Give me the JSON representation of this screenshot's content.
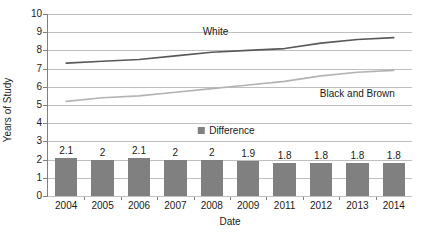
{
  "chart_data": {
    "type": "line",
    "title": "",
    "xlabel": "Date",
    "ylabel": "Years of Study",
    "categories": [
      "2004",
      "2005",
      "2006",
      "2007",
      "2008",
      "2009",
      "2011",
      "2012",
      "2013",
      "2014"
    ],
    "ylim": [
      0,
      10
    ],
    "y_ticks": [
      "0",
      "1",
      "2",
      "3",
      "4",
      "5",
      "6",
      "7",
      "8",
      "9",
      "10"
    ],
    "grid": true,
    "legend_position": "inside-center",
    "series": [
      {
        "name": "White",
        "type": "line",
        "color": "#595959",
        "values": [
          7.3,
          7.4,
          7.5,
          7.7,
          7.9,
          8.0,
          8.1,
          8.4,
          8.6,
          8.7
        ]
      },
      {
        "name": "Black and Brown",
        "type": "line",
        "color": "#b3b3b3",
        "values": [
          5.2,
          5.4,
          5.5,
          5.7,
          5.9,
          6.1,
          6.3,
          6.6,
          6.8,
          6.9
        ]
      },
      {
        "name": "Difference",
        "type": "bar",
        "color": "#808080",
        "values": [
          2.1,
          2,
          2.1,
          2,
          2,
          1.9,
          1.8,
          1.8,
          1.8,
          1.8
        ],
        "labels": [
          "2.1",
          "2",
          "2.1",
          "2",
          "2",
          "1.9",
          "1.8",
          "1.8",
          "1.8",
          "1.8"
        ]
      }
    ],
    "annotations": [
      {
        "text": "White",
        "x_index": 4.1,
        "y": 9.0
      },
      {
        "text": "Black and Brown",
        "x_index": 8.0,
        "y": 5.6
      }
    ],
    "legend_entries": [
      {
        "label": "Difference",
        "color": "#808080"
      }
    ],
    "legend_anchor": {
      "x_index": 4.4,
      "y": 3.55
    }
  },
  "colors": {
    "white_line": "#595959",
    "black_brown_line": "#b3b3b3",
    "difference_bar": "#808080",
    "gridline": "#bfbfbf",
    "axis": "#808080",
    "text": "#1a1a1a",
    "background": "#ffffff"
  }
}
